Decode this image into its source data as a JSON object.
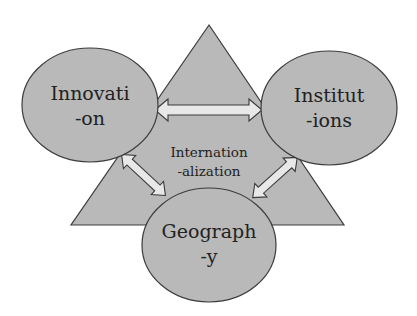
{
  "diagram": {
    "center": {
      "label_line1": "Internation",
      "label_line2": "-alization"
    },
    "nodes": [
      {
        "id": "innovation",
        "line1": "Innovati",
        "line2": "-on"
      },
      {
        "id": "institutions",
        "line1": "Institut",
        "line2": "-ions"
      },
      {
        "id": "geography",
        "line1": "Geograph",
        "line2": "-y"
      }
    ],
    "connections": [
      {
        "from": "innovation",
        "to": "institutions",
        "type": "bidirectional"
      },
      {
        "from": "innovation",
        "to": "geography",
        "type": "bidirectional"
      },
      {
        "from": "institutions",
        "to": "geography",
        "type": "bidirectional"
      }
    ],
    "colors": {
      "fill": "#b9b9b9",
      "stroke": "#3c3c3c",
      "arrow_fill": "#e8e8e8",
      "text": "#222222"
    }
  }
}
